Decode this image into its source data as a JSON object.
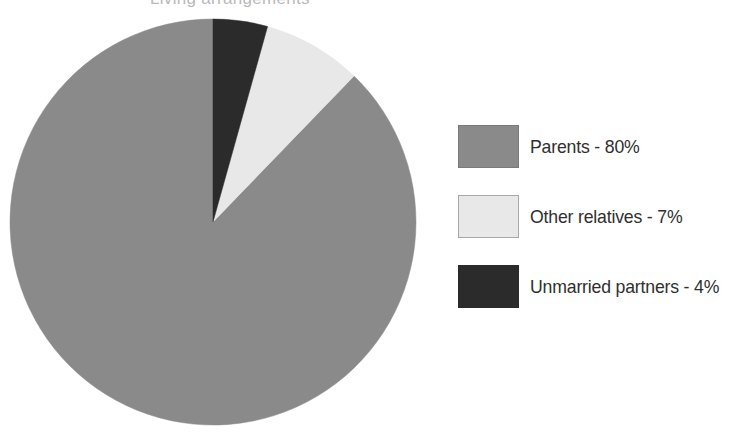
{
  "figure": {
    "background_color": "#ffffff",
    "width": 744,
    "height": 437,
    "title_remnant": "Living arrangements"
  },
  "chart_data": {
    "type": "pie",
    "title": "",
    "xlabel": "",
    "ylabel": "",
    "categories": [
      "Parents",
      "Other relatives",
      "Unmarried partners"
    ],
    "values": [
      80,
      7,
      4
    ],
    "value_unit": "%",
    "labels": [
      "Parents - 80%",
      "Other relatives - 7%",
      "Unmarried partners - 4%"
    ],
    "colors": [
      "#8a8a8a",
      "#e8e8e8",
      "#2b2b2b"
    ],
    "start_angle_deg": 90,
    "direction": "counterclockwise",
    "center": {
      "x": 213,
      "y": 222
    },
    "radius": 203,
    "slice_sweeps_deg": [
      316.0,
      28.4,
      15.6
    ],
    "grid": false,
    "legend_position": "right",
    "data_labels_shown": false,
    "total_shown": 91
  },
  "legend": {
    "items": [
      {
        "label": "Parents - 80%",
        "category": "Parents",
        "value": "80%",
        "swatch_color": "#8a8a8a",
        "swatch_border": "#7a7a7a"
      },
      {
        "label": "Other relatives - 7%",
        "category": "Other relatives",
        "value": "7%",
        "swatch_color": "#e8e8e8",
        "swatch_border": "#a8a8a8"
      },
      {
        "label": "Unmarried partners - 4%",
        "category": "Unmarried partners",
        "value": "4%",
        "swatch_color": "#2b2b2b",
        "swatch_border": "#2b2b2b"
      }
    ]
  }
}
